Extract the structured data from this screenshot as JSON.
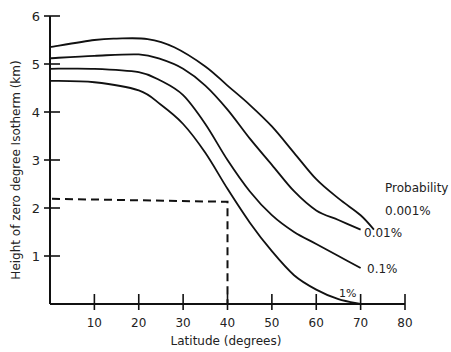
{
  "chart_data": {
    "type": "line",
    "title": "",
    "xlabel": "Latitude (degrees)",
    "ylabel": "Height of zero degree Isotherm (km)",
    "xlim": [
      0,
      80
    ],
    "ylim": [
      0,
      6
    ],
    "x_ticks": [
      10,
      20,
      30,
      40,
      50,
      60,
      70,
      80
    ],
    "y_ticks": [
      1,
      2,
      3,
      4,
      5,
      6
    ],
    "grid": false,
    "legend_title": "Probability",
    "legend_position": "right, inline labels at curve ends",
    "series": [
      {
        "name": "0.001%",
        "x": [
          0,
          10,
          15,
          22,
          28,
          35,
          40,
          45,
          50,
          55,
          60,
          65,
          70,
          73
        ],
        "y": [
          5.35,
          5.5,
          5.53,
          5.52,
          5.35,
          4.95,
          4.55,
          4.15,
          3.7,
          3.15,
          2.6,
          2.2,
          1.85,
          1.55
        ]
      },
      {
        "name": "0.01%",
        "x": [
          0,
          10,
          20,
          25,
          30,
          35,
          40,
          45,
          50,
          55,
          60,
          65,
          70
        ],
        "y": [
          5.12,
          5.17,
          5.2,
          5.1,
          4.9,
          4.55,
          4.05,
          3.45,
          2.9,
          2.35,
          1.95,
          1.75,
          1.55
        ]
      },
      {
        "name": "0.1%",
        "x": [
          0,
          10,
          20,
          25,
          30,
          35,
          40,
          45,
          50,
          55,
          60,
          65,
          70
        ],
        "y": [
          4.9,
          4.9,
          4.83,
          4.65,
          4.35,
          3.75,
          3.0,
          2.35,
          1.85,
          1.5,
          1.25,
          1.0,
          0.75
        ]
      },
      {
        "name": "1%",
        "x": [
          0,
          10,
          20,
          25,
          30,
          35,
          40,
          45,
          50,
          55,
          60,
          65,
          70
        ],
        "y": [
          4.65,
          4.62,
          4.45,
          4.15,
          3.75,
          3.15,
          2.4,
          1.7,
          1.1,
          0.6,
          0.3,
          0.1,
          0.0
        ]
      }
    ],
    "annotations": [
      {
        "type": "dashed-guide",
        "from_y_axis_at": 2.15,
        "to_x": 40,
        "then_down_to_x_axis": true
      }
    ]
  },
  "labels": {
    "xlabel": "Latitude (degrees)",
    "ylabel": "Height of zero degree Isotherm (km)",
    "legend_title": "Probability",
    "series_labels": [
      "0.001%",
      "0.01%",
      "0.1%",
      "1%"
    ],
    "x_tick_labels": [
      "10",
      "20",
      "30",
      "40",
      "50",
      "60",
      "70",
      "80"
    ],
    "y_tick_labels": [
      "1",
      "2",
      "3",
      "4",
      "5",
      "6"
    ]
  },
  "colors": {
    "line": "#111111",
    "text": "#222222",
    "background": "#ffffff"
  }
}
